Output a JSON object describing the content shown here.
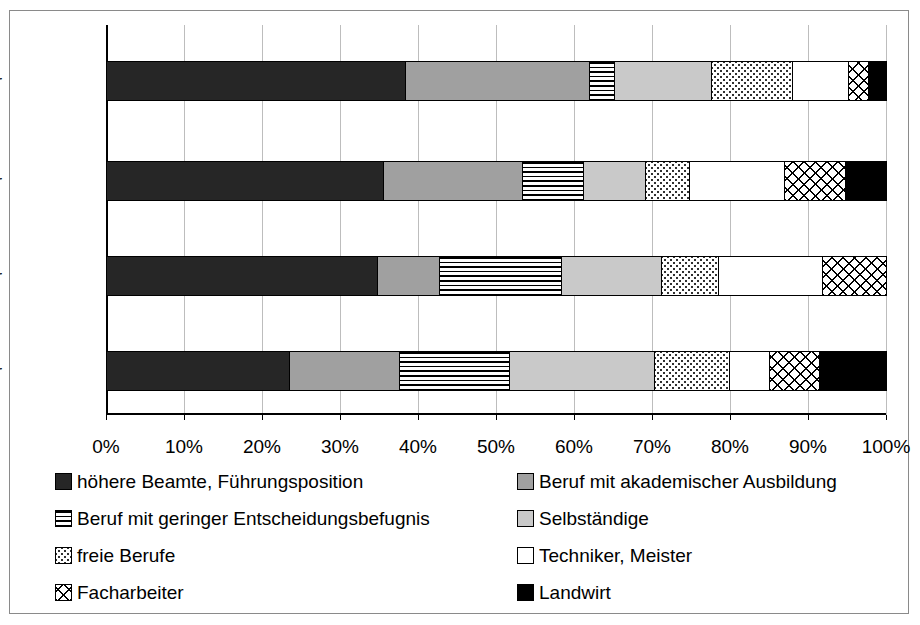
{
  "chart_data": {
    "type": "bar",
    "orientation": "horizontal",
    "stacked": true,
    "normalized": "percent",
    "title": "",
    "xlabel": "",
    "ylabel": "",
    "xlim": [
      0,
      100
    ],
    "grid": true,
    "legend_position": "bottom",
    "tick_labels": [
      "0%",
      "10%",
      "20%",
      "30%",
      "40%",
      "50%",
      "60%",
      "70%",
      "80%",
      "90%",
      "100%"
    ],
    "tick_values": [
      0,
      10,
      20,
      30,
      40,
      50,
      60,
      70,
      80,
      90,
      100
    ],
    "categories": [
      "2000er",
      "1990er",
      "1980er",
      "1970er"
    ],
    "series": [
      {
        "name": "höhere Beamte, Führungsposition",
        "pattern": "dark-solid",
        "color": "#262626",
        "values": [
          38.3,
          35.5,
          34.7,
          23.5
        ]
      },
      {
        "name": "Beruf mit akademischer Ausbildung",
        "pattern": "medium-gray",
        "color": "#a0a0a0",
        "values": [
          23.6,
          17.8,
          8.0,
          14.1
        ]
      },
      {
        "name": "Beruf mit geringer Entscheidungsbefugnis",
        "pattern": "horizontal-lines",
        "color": "#ffffff",
        "values": [
          3.2,
          7.9,
          15.6,
          14.1
        ]
      },
      {
        "name": "Selbständige",
        "pattern": "light-gray",
        "color": "#c9c9c9",
        "values": [
          12.4,
          7.9,
          12.8,
          18.6
        ]
      },
      {
        "name": "freie Berufe",
        "pattern": "fine-dots",
        "color": "#ffffff",
        "values": [
          10.5,
          5.6,
          7.4,
          9.6
        ]
      },
      {
        "name": "Techniker, Meister",
        "pattern": "white",
        "color": "#ffffff",
        "values": [
          7.1,
          12.2,
          13.3,
          5.1
        ]
      },
      {
        "name": "Facharbeiter",
        "pattern": "cross-hatch",
        "color": "#ffffff",
        "values": [
          2.6,
          7.9,
          8.2,
          6.4
        ]
      },
      {
        "name": "Landwirt",
        "pattern": "black",
        "color": "#000000",
        "values": [
          2.3,
          5.2,
          0.0,
          8.6
        ]
      }
    ]
  },
  "axis": {
    "ticks": [
      {
        "label": "0%",
        "value": 0
      },
      {
        "label": "10%",
        "value": 10
      },
      {
        "label": "20%",
        "value": 20
      },
      {
        "label": "30%",
        "value": 30
      },
      {
        "label": "40%",
        "value": 40
      },
      {
        "label": "50%",
        "value": 50
      },
      {
        "label": "60%",
        "value": 60
      },
      {
        "label": "70%",
        "value": 70
      },
      {
        "label": "80%",
        "value": 80
      },
      {
        "label": "90%",
        "value": 90
      },
      {
        "label": "100%",
        "value": 100
      }
    ],
    "categories": [
      {
        "label": "2000er"
      },
      {
        "label": "1990er"
      },
      {
        "label": "1980er"
      },
      {
        "label": "1970er"
      }
    ]
  },
  "legend": {
    "left_column": [
      {
        "label": "höhere Beamte, Führungsposition",
        "pattern": "dark-solid"
      },
      {
        "label": "Beruf mit geringer Entscheidungsbefugnis",
        "pattern": "horizontal-lines"
      },
      {
        "label": "freie Berufe",
        "pattern": "fine-dots"
      },
      {
        "label": "Facharbeiter",
        "pattern": "cross-hatch"
      }
    ],
    "right_column": [
      {
        "label": "Beruf mit akademischer Ausbildung",
        "pattern": "medium-gray"
      },
      {
        "label": "Selbständige",
        "pattern": "light-gray"
      },
      {
        "label": "Techniker, Meister",
        "pattern": "white"
      },
      {
        "label": "Landwirt",
        "pattern": "black"
      }
    ]
  },
  "colors": {
    "dark_solid": "#262626",
    "medium_gray": "#a0a0a0",
    "light_gray": "#c9c9c9",
    "black": "#000000",
    "white": "#ffffff",
    "gridline": "#bdbdbd",
    "frame": "#8a8a8a"
  }
}
